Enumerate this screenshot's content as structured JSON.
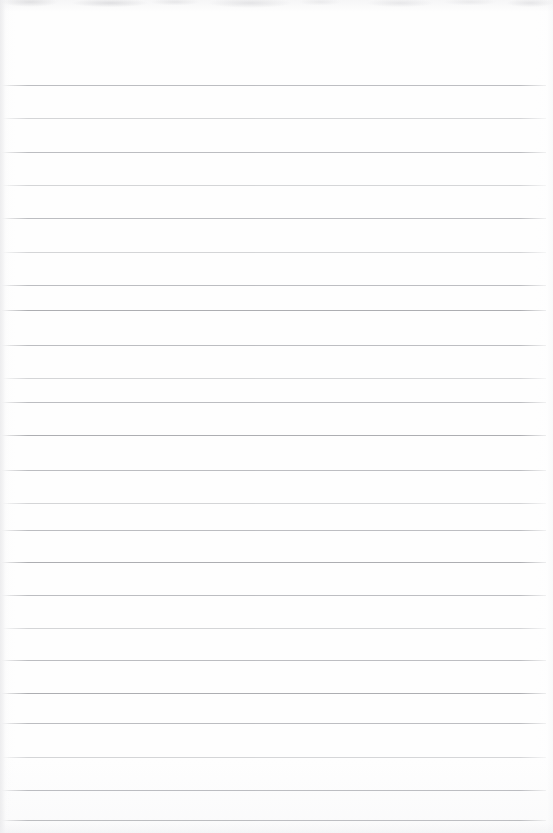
{
  "document": {
    "kind": "scanned-lined-paper",
    "page_width": 553,
    "page_height": 833,
    "background_color": "#fefefe",
    "content_text": "",
    "is_blank": true
  },
  "ruling": {
    "line_color": "#b9babd",
    "line_thickness_px": 1,
    "line_spacing_px": 33.4,
    "first_line_y": 85,
    "line_count": 23,
    "left_x": 2,
    "right_x": 546,
    "line_length_px": 544,
    "lines": [
      {
        "index": 1,
        "y": 85,
        "weight": "medium"
      },
      {
        "index": 2,
        "y": 118,
        "weight": "faint"
      },
      {
        "index": 3,
        "y": 152,
        "weight": "medium"
      },
      {
        "index": 4,
        "y": 185,
        "weight": "faint"
      },
      {
        "index": 5,
        "y": 218,
        "weight": "medium"
      },
      {
        "index": 6,
        "y": 252,
        "weight": "faint"
      },
      {
        "index": 7,
        "y": 285,
        "weight": "medium"
      },
      {
        "index": 8,
        "y": 310,
        "weight": "dark"
      },
      {
        "index": 9,
        "y": 345,
        "weight": "medium"
      },
      {
        "index": 10,
        "y": 378,
        "weight": "faint"
      },
      {
        "index": 11,
        "y": 402,
        "weight": "medium"
      },
      {
        "index": 12,
        "y": 435,
        "weight": "dark"
      },
      {
        "index": 13,
        "y": 470,
        "weight": "medium"
      },
      {
        "index": 14,
        "y": 503,
        "weight": "faint"
      },
      {
        "index": 15,
        "y": 530,
        "weight": "medium"
      },
      {
        "index": 16,
        "y": 562,
        "weight": "dark"
      },
      {
        "index": 17,
        "y": 595,
        "weight": "medium"
      },
      {
        "index": 18,
        "y": 628,
        "weight": "faint"
      },
      {
        "index": 19,
        "y": 660,
        "weight": "medium"
      },
      {
        "index": 20,
        "y": 693,
        "weight": "dark"
      },
      {
        "index": 21,
        "y": 723,
        "weight": "medium"
      },
      {
        "index": 22,
        "y": 757,
        "weight": "faint"
      },
      {
        "index": 23,
        "y": 790,
        "weight": "medium"
      },
      {
        "index": 24,
        "y": 820,
        "weight": "medium"
      }
    ]
  },
  "scan_artifacts": {
    "top_edge_noise": true,
    "left_edge_band": true,
    "bottom_edge_shade": true,
    "noise_color": "#cfd0d3"
  }
}
